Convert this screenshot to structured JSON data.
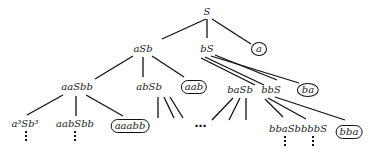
{
  "tree": {
    "root": "S",
    "nodes": {
      "S": {
        "label": "S",
        "terminal": false
      },
      "aSb": {
        "label": "aSb",
        "terminal": false
      },
      "bS": {
        "label": "bS",
        "terminal": false
      },
      "a": {
        "label": "a",
        "terminal": true
      },
      "aaSbb": {
        "label": "aaSbb",
        "terminal": false
      },
      "abSb": {
        "label": "abSb",
        "terminal": false
      },
      "aab": {
        "label": "aab",
        "terminal": true
      },
      "baSb": {
        "label": "baSb",
        "terminal": false
      },
      "bbS": {
        "label": "bbS",
        "terminal": false
      },
      "ba": {
        "label": "ba",
        "terminal": true
      },
      "a3Sb3": {
        "label": "a³Sb³",
        "terminal": false
      },
      "aabSbb": {
        "label": "aabSbb",
        "terminal": false
      },
      "aaabb": {
        "label": "aaabb",
        "terminal": true
      },
      "bbaSb": {
        "label": "bbaSb",
        "terminal": false
      },
      "bbbS": {
        "label": "bbbS",
        "terminal": false
      },
      "bba": {
        "label": "bba",
        "terminal": true
      }
    },
    "continuation_symbol": "⋯"
  }
}
